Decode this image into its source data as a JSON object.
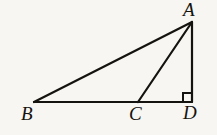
{
  "figure": {
    "kind": "geometry-diagram",
    "background_color": "#f7f6f3",
    "stroke_color": "#15130f",
    "stroke_width": 2.2,
    "canvas": {
      "width": 217,
      "height": 135
    },
    "points": {
      "A": {
        "label": "A",
        "x": 192,
        "y": 22
      },
      "B": {
        "label": "B",
        "x": 34,
        "y": 102
      },
      "C": {
        "label": "C",
        "x": 138,
        "y": 102
      },
      "D": {
        "label": "D",
        "x": 192,
        "y": 102
      }
    },
    "segments": [
      {
        "name": "BA",
        "from": "B",
        "to": "A"
      },
      {
        "name": "BD",
        "from": "B",
        "to": "D"
      },
      {
        "name": "CA",
        "from": "C",
        "to": "A"
      },
      {
        "name": "AD",
        "from": "A",
        "to": "D"
      }
    ],
    "right_angle": {
      "at": "D",
      "marker": "square",
      "size": 9
    },
    "labels": {
      "A": "A",
      "B": "B",
      "C": "C",
      "D": "D"
    }
  }
}
